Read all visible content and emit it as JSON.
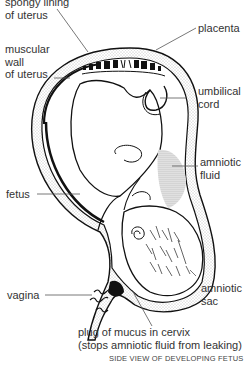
{
  "title": "SIDE VIEW OF DEVELOPING FETUS",
  "labels": {
    "spongy_lining": [
      "spongy lining",
      "of uterus"
    ],
    "muscular_wall": [
      "muscular",
      "wall",
      "of uterus"
    ],
    "placenta": "placenta",
    "umbilical_cord": [
      "umbilical",
      "cord"
    ],
    "amniotic_fluid": [
      "amniotic",
      "fluid"
    ],
    "fetus": "fetus",
    "vagina": "vagina",
    "amniotic_sac": [
      "amniotic",
      "sac"
    ],
    "mucus_plug": [
      "plug of mucus in cervix",
      "(stops amniotic fluid from leaking)"
    ]
  },
  "colors": {
    "ink": "#111111",
    "label_text": "#333333",
    "leader_line": "#555555",
    "stipple": "#888888"
  }
}
